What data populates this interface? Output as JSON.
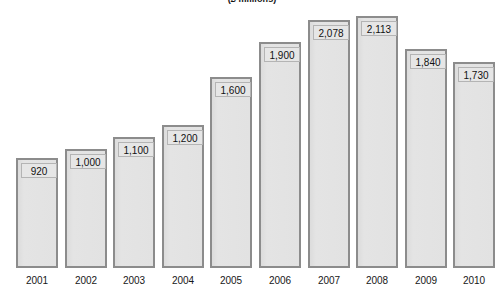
{
  "chart_data": {
    "type": "bar",
    "title": "(£ millions)",
    "subtitle": "",
    "xlabel": "",
    "ylabel": "",
    "categories": [
      "2001",
      "2002",
      "2003",
      "2004",
      "2005",
      "2006",
      "2007",
      "2008",
      "2009",
      "2010"
    ],
    "values": [
      920,
      1000,
      1100,
      1200,
      1600,
      1900,
      2078,
      2113,
      1840,
      1730
    ],
    "value_labels": [
      "920",
      "1,000",
      "1,100",
      "1,200",
      "1,600",
      "1,900",
      "2,078",
      "2,113",
      "1,840",
      "1,730"
    ],
    "ylim": [
      0,
      2250
    ],
    "grid": false,
    "legend": null,
    "legend_position": "none",
    "axis_tick_labels_visible": true,
    "y_axis_visible": false,
    "data_labels_inside_bars": true
  },
  "style": {
    "bar_fill": "#e1e1e1",
    "bar_border": "#8c8c8c",
    "label_box_fill": "#e6e6e6",
    "label_box_border": "#b4b4b4",
    "text_color": "#171717",
    "background": "#ffffff"
  }
}
